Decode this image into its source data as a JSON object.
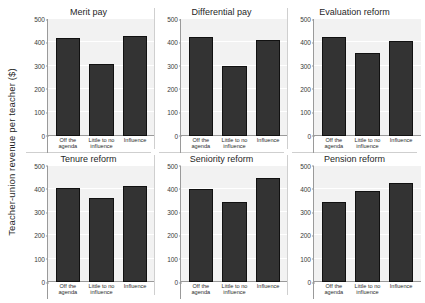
{
  "chart_data": {
    "type": "bar",
    "title": "",
    "xlabel": "",
    "ylabel": "Teacher-union revenue per teacher ($)",
    "ylim": [
      0,
      500
    ],
    "yticks": [
      0,
      100,
      200,
      300,
      400,
      500
    ],
    "ytick_labels": [
      "0",
      "100",
      "200",
      "300",
      "400",
      "500"
    ],
    "grid": true,
    "legend": "none",
    "categories": [
      "Off the agenda",
      "Little to no influence",
      "Influence"
    ],
    "panels": [
      {
        "title": "Merit pay",
        "values": [
          420,
          307,
          427
        ]
      },
      {
        "title": "Differential pay",
        "values": [
          424,
          300,
          411
        ]
      },
      {
        "title": "Evaluation reform",
        "values": [
          421,
          352,
          407
        ]
      },
      {
        "title": "Tenure reform",
        "values": [
          405,
          360,
          413
        ]
      },
      {
        "title": "Seniority reform",
        "values": [
          400,
          344,
          447
        ]
      },
      {
        "title": "Pension reform",
        "values": [
          342,
          390,
          423
        ]
      }
    ]
  }
}
